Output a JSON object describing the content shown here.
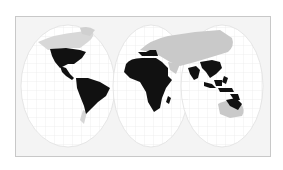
{
  "map": {
    "projection": "interrupted three-lobe world map",
    "colors": {
      "background": "#f4f4f4",
      "frame_border": "#c8c8c8",
      "ocean_lobe": "#ffffff",
      "graticule": "#e2e2e2",
      "highlighted_land": "#111111",
      "other_land": "#c9c9c9"
    },
    "regions_highlighted": [
      "North America (USA, Mexico)",
      "Central America",
      "South America",
      "Sub-Saharan and North Africa",
      "South Asia",
      "Southeast Asia",
      "Indonesia / Maritime Southeast Asia",
      "Northern Australia / New Guinea"
    ],
    "regions_unhighlighted": [
      "Canada / Greenland",
      "Europe / Northern Asia",
      "Sahara",
      "Arabian Peninsula",
      "Australia interior",
      "Southern South America tip"
    ]
  }
}
